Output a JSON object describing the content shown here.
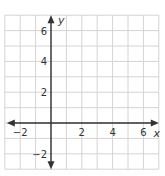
{
  "chart_data": {
    "type": "scatter",
    "title": "",
    "xlabel": "x",
    "ylabel": "y",
    "xlim": [
      -3,
      7
    ],
    "ylim": [
      -3,
      7
    ],
    "grid": true,
    "grid_step": 1,
    "x_ticks": [
      -2,
      2,
      4,
      6
    ],
    "y_ticks": [
      -2,
      2,
      4,
      6
    ],
    "x_tick_labels": [
      "−2",
      "2",
      "4",
      "6"
    ],
    "y_tick_labels": [
      "−2",
      "2",
      "4",
      "6"
    ],
    "series": []
  },
  "colors": {
    "grid": "#d4d4d4",
    "axis": "#333333",
    "background": "#ffffff"
  }
}
